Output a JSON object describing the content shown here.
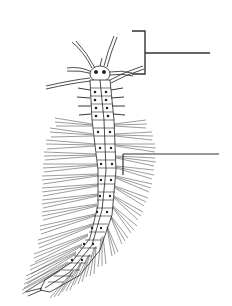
{
  "figure": {
    "background": "#ffffff",
    "ink": "#222222",
    "labels": [
      {
        "id": "head-pointer",
        "text": "",
        "bracket": {
          "x": 145,
          "top": 31,
          "bottom": 74,
          "arm": 132
        },
        "line": {
          "y": 53,
          "x1": 145,
          "x2": 210
        }
      },
      {
        "id": "parapodia-pointer",
        "text": "",
        "leg": {
          "x": 123,
          "top": 154,
          "bottom": 175
        },
        "line": {
          "y": 154,
          "x1": 123,
          "x2": 219
        }
      }
    ]
  }
}
